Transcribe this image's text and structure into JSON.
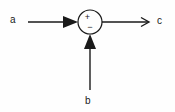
{
  "diagram": {
    "type": "summing-junction-block-diagram",
    "background_color": "#fefefe",
    "stroke_color": "#1a1a1a",
    "summing_junction": {
      "name": "summing-junction",
      "shape": "circle",
      "center_x": 90,
      "center_y": 22,
      "radius": 12,
      "plus_sign": "+",
      "minus_sign": "−"
    },
    "signals": [
      {
        "id": "a",
        "label": "a",
        "role": "input",
        "direction": "left-to-right",
        "arrowhead": "solid-triangle",
        "sign": "+"
      },
      {
        "id": "b",
        "label": "b",
        "role": "input",
        "direction": "bottom-to-top",
        "arrowhead": "solid-triangle",
        "sign": "−"
      },
      {
        "id": "c",
        "label": "c",
        "role": "output",
        "direction": "left-to-right",
        "arrowhead": "open-line",
        "sign": ""
      }
    ]
  }
}
